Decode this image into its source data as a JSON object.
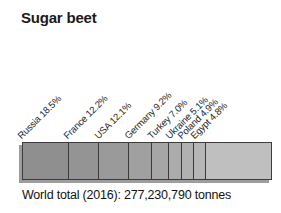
{
  "chart_title": "Sugar beet",
  "caption": "World total (2016): 277,230,790 tonnes",
  "chart_data": {
    "type": "bar",
    "subtype": "stacked-horizontal-100pct",
    "title": "Sugar beet",
    "subtitle": "",
    "xlabel": "",
    "ylabel": "",
    "xlim": [
      0,
      100
    ],
    "grid": false,
    "legend": "none",
    "units": "percent of world total",
    "annotation": "World total (2016): 277,230,790 tonnes",
    "world_total_year": "2016",
    "world_total_tonnes": "277,230,790",
    "categories": [
      "Russia",
      "France",
      "USA",
      "Germany",
      "Turkey",
      "Ukraine",
      "Poland",
      "Egypt",
      "Other"
    ],
    "values": [
      18.5,
      12.2,
      12.1,
      9.2,
      7.0,
      5.1,
      4.9,
      4.8,
      26.2
    ],
    "segments": [
      {
        "label": "Russia 18.5%",
        "name": "Russia",
        "value": 18.5,
        "value_text": "18.5%",
        "color": "#8f8f8f",
        "labeled": true
      },
      {
        "label": "France 12.2%",
        "name": "France",
        "value": 12.2,
        "value_text": "12.2%",
        "color": "#949494",
        "labeled": true
      },
      {
        "label": "USA 12.1%",
        "name": "USA",
        "value": 12.1,
        "value_text": "12.1%",
        "color": "#9a9a9a",
        "labeled": true
      },
      {
        "label": "Germany 9.2%",
        "name": "Germany",
        "value": 9.2,
        "value_text": "9.2%",
        "color": "#a0a0a0",
        "labeled": true
      },
      {
        "label": "Turkey 7.0%",
        "name": "Turkey",
        "value": 7.0,
        "value_text": "7.0%",
        "color": "#a6a6a6",
        "labeled": true
      },
      {
        "label": "Ukraine 5.1%",
        "name": "Ukraine",
        "value": 5.1,
        "value_text": "5.1%",
        "color": "#acacac",
        "labeled": true
      },
      {
        "label": "Poland 4.9%",
        "name": "Poland",
        "value": 4.9,
        "value_text": "4.9%",
        "color": "#b1b1b1",
        "labeled": true
      },
      {
        "label": "Egypt 4.8%",
        "name": "Egypt",
        "value": 4.8,
        "value_text": "4.8%",
        "color": "#b6b6b6",
        "labeled": true
      },
      {
        "label": "",
        "name": "Other",
        "value": 26.2,
        "value_text": "",
        "color": "#bfbfbf",
        "labeled": false
      }
    ]
  },
  "style": {
    "background": "#ffffff",
    "text_color": "#1a1a1a",
    "bar_border_color": "#3c3c3c",
    "shadow_color": "#9d9d9d"
  }
}
